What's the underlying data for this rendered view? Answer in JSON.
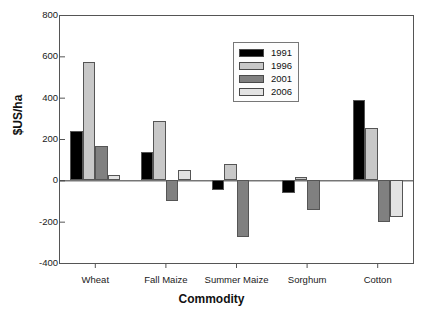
{
  "chart_data": {
    "type": "bar",
    "title": "",
    "xlabel": "Commodity",
    "ylabel": "$US/ha",
    "categories": [
      "Wheat",
      "Fall Maize",
      "Summer Maize",
      "Sorghum",
      "Cotton"
    ],
    "series": [
      {
        "name": "1991",
        "color": "#000000",
        "values": [
          240,
          135,
          -45,
          -62,
          388
        ]
      },
      {
        "name": "1996",
        "color": "#c8c8c8",
        "values": [
          575,
          288,
          80,
          14,
          255
        ]
      },
      {
        "name": "2001",
        "color": "#808080",
        "values": [
          165,
          -102,
          -275,
          -145,
          -202
        ]
      },
      {
        "name": "2006",
        "color": "#e3e3e3",
        "values": [
          28,
          48,
          0,
          0,
          -178
        ]
      }
    ],
    "ylim": [
      -400,
      800
    ],
    "yticks": [
      800,
      600,
      400,
      200,
      0,
      -200,
      -400
    ],
    "ytick_labels": [
      "800",
      "600",
      "400",
      "200",
      "0",
      "-200",
      "-400"
    ],
    "grid": false,
    "legend_position": "top-center",
    "zero_line": true
  },
  "axes": {
    "y_axis_title": "$US/ha",
    "x_axis_title": "Commodity"
  },
  "legend": {
    "entries": [
      {
        "label": "1991",
        "swatch": "#000000"
      },
      {
        "label": "1996",
        "swatch": "#c8c8c8"
      },
      {
        "label": "2001",
        "swatch": "#808080"
      },
      {
        "label": "2006",
        "swatch": "#e3e3e3"
      }
    ]
  }
}
